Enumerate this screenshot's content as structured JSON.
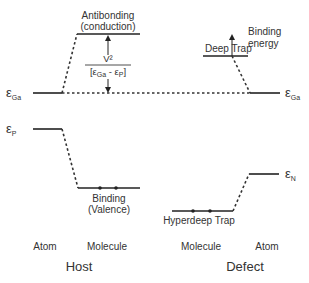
{
  "diagram": {
    "host": {
      "group_label": "Host",
      "columns": [
        "Atom",
        "Molecule"
      ],
      "atom_levels": [
        {
          "symbol": "ε",
          "subscript": "Ga"
        },
        {
          "symbol": "ε",
          "subscript": "P"
        }
      ],
      "antibonding_label_line1": "Antibonding",
      "antibonding_label_line2": "(conduction)",
      "binding_label_line1": "Binding",
      "binding_label_line2": "(Valence)",
      "fraction_numerator": "V²",
      "fraction_denominator_a": "ε",
      "fraction_denominator_a_sub": "Ga",
      "fraction_denominator_op": " - ",
      "fraction_denominator_b": "ε",
      "fraction_denominator_b_sub": "P",
      "binding_electrons": 2
    },
    "defect": {
      "group_label": "Defect",
      "columns": [
        "Molecule",
        "Atom"
      ],
      "atom_levels": [
        {
          "symbol": "ε",
          "subscript": "Ga"
        },
        {
          "symbol": "ε",
          "subscript": "N"
        }
      ],
      "deep_trap_label": "Deep Trap",
      "hyperdeep_trap_label": "Hyperdeep Trap",
      "binding_energy_line1": "Binding",
      "binding_energy_line2": "energy",
      "hyperdeep_electrons": 2
    }
  }
}
